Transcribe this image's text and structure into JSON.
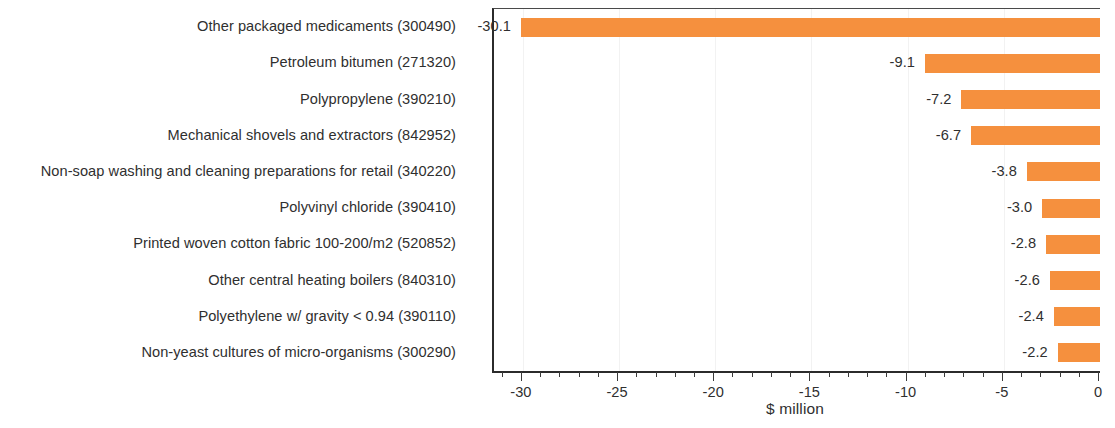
{
  "chart_data": {
    "type": "bar",
    "orientation": "horizontal",
    "title": "",
    "subtitle": "",
    "xlabel": "$ million",
    "ylabel": "",
    "xlim": [
      -31.5,
      0
    ],
    "xticks": [
      -30,
      -25,
      -20,
      -15,
      -10,
      -5,
      0
    ],
    "xtick_labels": [
      "-30",
      "-25",
      "-20",
      "-15",
      "-10",
      "-5",
      "0"
    ],
    "minor_tick_step": 1,
    "grid": "vertical-major-faint",
    "legend": "none",
    "bar_color": "#f5903e",
    "categories": [
      "Other packaged medicaments (300490)",
      "Petroleum bitumen (271320)",
      "Polypropylene (390210)",
      "Mechanical shovels and extractors (842952)",
      "Non-soap washing and cleaning preparations for retail (340220)",
      "Polyvinyl chloride (390410)",
      "Printed woven cotton fabric 100-200/m2 (520852)",
      "Other central heating boilers (840310)",
      "Polyethylene w/ gravity < 0.94 (390110)",
      "Non-yeast cultures of micro-organisms (300290)"
    ],
    "values": [
      -30.1,
      -9.1,
      -7.2,
      -6.7,
      -3.8,
      -3.0,
      -2.8,
      -2.6,
      -2.4,
      -2.2
    ],
    "value_labels": [
      "-30.1",
      "-9.1",
      "-7.2",
      "-6.7",
      "-3.8",
      "-3.0",
      "-2.8",
      "-2.6",
      "-2.4",
      "-2.2"
    ]
  }
}
